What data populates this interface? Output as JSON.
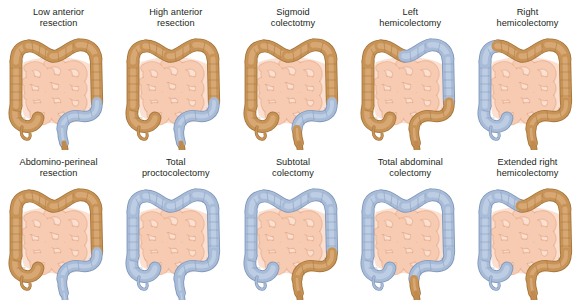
{
  "figure": {
    "background": "#ffffff",
    "caption_color": "#231f20"
  },
  "palette": {
    "retained_colon_fill": "#c89356",
    "retained_colon_fill_light": "#d9ab78",
    "retained_colon_stroke": "#a5763c",
    "resected_colon_fill": "#a8bcd8",
    "resected_colon_fill_light": "#bfcee4",
    "resected_colon_stroke": "#8198bb",
    "small_bowel_fill": "#f7cbb2",
    "small_bowel_stroke": "#e09f7d",
    "mesentery_fill": "#fbe0d2",
    "anal_canal_fill": "#c18a4e"
  },
  "legend": {
    "retained_label": "Retained bowel (brown)",
    "resected_label": "Resected segment (blue)"
  },
  "segment_names": {
    "cecum": "cecum",
    "appendix": "appendix",
    "ascending": "ascending-colon",
    "hepatic_flexure": "hepatic-flexure",
    "transverse_right": "transverse-colon-right",
    "transverse_left": "transverse-colon-left",
    "splenic_flexure": "splenic-flexure",
    "descending": "descending-colon",
    "sigmoid": "sigmoid-colon",
    "rectum": "rectum",
    "anus": "anal-canal"
  },
  "panels": [
    {
      "id": "low-anterior-resection",
      "row": 0,
      "column": 0,
      "caption": "Low anterior\nresection",
      "caption_line1": "Low anterior",
      "caption_line2": "resection",
      "resected": [
        "sigmoid",
        "rectum"
      ],
      "retained": [
        "cecum",
        "appendix",
        "ascending",
        "hepatic_flexure",
        "transverse_right",
        "transverse_left",
        "splenic_flexure",
        "descending",
        "anus"
      ],
      "has_anus": true
    },
    {
      "id": "high-anterior-resection",
      "row": 0,
      "column": 1,
      "caption": "High anterior\nresection",
      "caption_line1": "High anterior",
      "caption_line2": "resection",
      "resected": [
        "sigmoid",
        "rectum"
      ],
      "retained": [
        "cecum",
        "appendix",
        "ascending",
        "hepatic_flexure",
        "transverse_right",
        "transverse_left",
        "splenic_flexure",
        "descending",
        "anus"
      ],
      "has_anus": true
    },
    {
      "id": "sigmoid-colectomy",
      "row": 0,
      "column": 2,
      "caption": "Sigmoid\ncolectotmy",
      "caption_line1": "Sigmoid",
      "caption_line2": "colectotmy",
      "resected": [
        "sigmoid"
      ],
      "retained": [
        "cecum",
        "appendix",
        "ascending",
        "hepatic_flexure",
        "transverse_right",
        "transverse_left",
        "splenic_flexure",
        "descending",
        "rectum",
        "anus"
      ],
      "has_anus": true
    },
    {
      "id": "left-hemicolectomy",
      "row": 0,
      "column": 3,
      "caption": "Left\nhemicolectomy",
      "caption_line1": "Left",
      "caption_line2": "hemicolectomy",
      "resected": [
        "transverse_left",
        "splenic_flexure",
        "descending"
      ],
      "retained": [
        "cecum",
        "appendix",
        "ascending",
        "hepatic_flexure",
        "transverse_right",
        "sigmoid",
        "rectum",
        "anus"
      ],
      "has_anus": true
    },
    {
      "id": "right-hemicolectomy",
      "row": 0,
      "column": 4,
      "caption": "Right\nhemicolectomy",
      "caption_line1": "Right",
      "caption_line2": "hemicolectomy",
      "resected": [
        "cecum",
        "appendix",
        "ascending",
        "hepatic_flexure"
      ],
      "retained": [
        "transverse_right",
        "transverse_left",
        "splenic_flexure",
        "descending",
        "sigmoid",
        "rectum",
        "anus"
      ],
      "has_anus": true
    },
    {
      "id": "abdomino-perineal-resection",
      "row": 1,
      "column": 0,
      "caption": "Abdomino-perineal\nresection",
      "caption_line1": "Abdomino-perineal",
      "caption_line2": "resection",
      "resected": [
        "sigmoid",
        "rectum",
        "anus"
      ],
      "retained": [
        "cecum",
        "appendix",
        "ascending",
        "hepatic_flexure",
        "transverse_right",
        "transverse_left",
        "splenic_flexure",
        "descending"
      ],
      "has_anus": true
    },
    {
      "id": "total-proctocolectomy",
      "row": 1,
      "column": 1,
      "caption": "Total\nproctocolectomy",
      "caption_line1": "Total",
      "caption_line2": "proctocolectomy",
      "resected": [
        "cecum",
        "appendix",
        "ascending",
        "hepatic_flexure",
        "transverse_right",
        "transverse_left",
        "splenic_flexure",
        "descending",
        "sigmoid",
        "rectum",
        "anus"
      ],
      "retained": [],
      "has_anus": true
    },
    {
      "id": "subtotal-colectomy",
      "row": 1,
      "column": 2,
      "caption": "Subtotal\ncolectomy",
      "caption_line1": "Subtotal",
      "caption_line2": "colectomy",
      "resected": [
        "cecum",
        "appendix",
        "ascending",
        "hepatic_flexure",
        "transverse_right",
        "transverse_left",
        "splenic_flexure",
        "descending"
      ],
      "retained": [
        "sigmoid",
        "rectum",
        "anus"
      ],
      "has_anus": true
    },
    {
      "id": "total-abdominal-colectomy",
      "row": 1,
      "column": 3,
      "caption": "Total abdominal\ncolectomy",
      "caption_line1": "Total abdominal",
      "caption_line2": "colectomy",
      "resected": [
        "cecum",
        "appendix",
        "ascending",
        "hepatic_flexure",
        "transverse_right",
        "transverse_left",
        "splenic_flexure",
        "descending",
        "sigmoid"
      ],
      "retained": [
        "rectum",
        "anus"
      ],
      "has_anus": true
    },
    {
      "id": "extended-right-hemicolectomy",
      "row": 1,
      "column": 4,
      "caption": "Extended right\nhemicolectomy",
      "caption_line1": "Extended right",
      "caption_line2": "hemicolectomy",
      "resected": [
        "cecum",
        "appendix",
        "ascending",
        "hepatic_flexure",
        "transverse_right"
      ],
      "retained": [
        "transverse_left",
        "splenic_flexure",
        "descending",
        "sigmoid",
        "rectum",
        "anus"
      ],
      "has_anus": true
    }
  ]
}
